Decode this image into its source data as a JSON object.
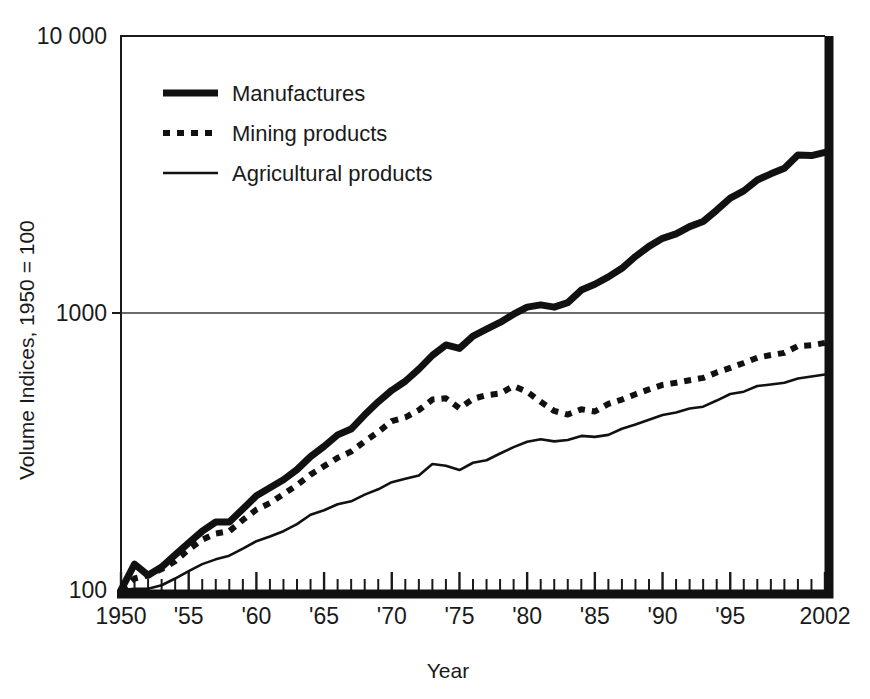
{
  "chart_data": {
    "type": "line",
    "title": "",
    "xlabel": "Year",
    "ylabel": "Volume Indices, 1950 = 100",
    "yscale": "log",
    "ylim": [
      100,
      10000
    ],
    "xlim": [
      1950,
      2002
    ],
    "grid": "single horizontal gridline at 1000",
    "legend_position": "top-left inside plot",
    "y_tick_labels": [
      "10 000",
      "1000",
      "100"
    ],
    "y_tick_values": [
      10000,
      1000,
      100
    ],
    "x_tick_labels": [
      "1950",
      "'55",
      "'60",
      "'65",
      "'70",
      "'75",
      "'80",
      "'85",
      "'90",
      "'95",
      "2002"
    ],
    "x_tick_values": [
      1950,
      1955,
      1960,
      1965,
      1970,
      1975,
      1980,
      1985,
      1990,
      1995,
      2002
    ],
    "x_minor_tick_step": 1,
    "x": [
      1950,
      1951,
      1952,
      1953,
      1954,
      1955,
      1956,
      1957,
      1958,
      1959,
      1960,
      1961,
      1962,
      1963,
      1964,
      1965,
      1966,
      1967,
      1968,
      1969,
      1970,
      1971,
      1972,
      1973,
      1974,
      1975,
      1976,
      1977,
      1978,
      1979,
      1980,
      1981,
      1982,
      1983,
      1984,
      1985,
      1986,
      1987,
      1988,
      1989,
      1990,
      1991,
      1992,
      1993,
      1994,
      1995,
      1996,
      1997,
      1998,
      1999,
      2000,
      2001,
      2002
    ],
    "series": [
      {
        "name": "Manufactures",
        "style": "thick-solid",
        "color": "#111111",
        "values": [
          100,
          124,
          113,
          121,
          134,
          148,
          163,
          176,
          176,
          196,
          219,
          234,
          250,
          272,
          303,
          330,
          363,
          381,
          429,
          478,
          526,
          567,
          627,
          703,
          767,
          745,
          825,
          874,
          925,
          990,
          1050,
          1070,
          1050,
          1090,
          1210,
          1270,
          1350,
          1450,
          1600,
          1740,
          1860,
          1930,
          2050,
          2140,
          2350,
          2600,
          2760,
          3020,
          3180,
          3330,
          3720,
          3700,
          3800
        ]
      },
      {
        "name": "Mining products",
        "style": "dotted",
        "color": "#111111",
        "values": [
          100,
          110,
          113,
          119,
          127,
          140,
          152,
          160,
          163,
          179,
          195,
          206,
          222,
          239,
          261,
          280,
          300,
          316,
          344,
          372,
          407,
          420,
          446,
          487,
          492,
          453,
          490,
          505,
          512,
          545,
          520,
          478,
          443,
          430,
          449,
          441,
          470,
          487,
          509,
          530,
          550,
          560,
          572,
          583,
          610,
          634,
          660,
          690,
          705,
          718,
          760,
          765,
          780
        ]
      },
      {
        "name": "Agricultural products",
        "style": "thin-solid",
        "color": "#111111",
        "values": [
          100,
          101,
          101,
          104,
          110,
          117,
          124,
          129,
          133,
          141,
          150,
          156,
          163,
          173,
          187,
          194,
          204,
          209,
          221,
          231,
          245,
          252,
          259,
          285,
          281,
          271,
          288,
          294,
          311,
          328,
          343,
          350,
          344,
          348,
          360,
          357,
          363,
          382,
          396,
          412,
          428,
          437,
          452,
          459,
          483,
          510,
          520,
          545,
          552,
          560,
          580,
          590,
          600
        ]
      }
    ]
  },
  "legend": {
    "items": [
      {
        "label": "Manufactures",
        "style": "thick-solid"
      },
      {
        "label": "Mining products",
        "style": "dotted"
      },
      {
        "label": "Agricultural products",
        "style": "thin-solid"
      }
    ]
  },
  "axes": {
    "y_title": "Volume Indices, 1950 = 100",
    "x_title": "Year"
  }
}
